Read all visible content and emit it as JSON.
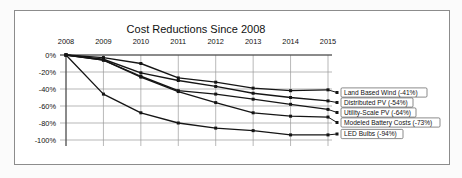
{
  "chart_data": {
    "type": "line",
    "title": "Cost Reductions Since 2008",
    "xlabel": "",
    "ylabel": "",
    "x": [
      "2008",
      "2009",
      "2010",
      "2011",
      "2012",
      "2013",
      "2014",
      "2015"
    ],
    "categories": [
      "2008",
      "2009",
      "2010",
      "2011",
      "2012",
      "2013",
      "2014",
      "2015"
    ],
    "ytick_labels": [
      "0%",
      "-20%",
      "-40%",
      "-60%",
      "-80%",
      "-100%"
    ],
    "ytick_values": [
      0,
      -20,
      -40,
      -60,
      -80,
      -100
    ],
    "ylim": [
      -100,
      0
    ],
    "grid": true,
    "xaxis_position": "top",
    "legend_position": "right-callouts",
    "series": [
      {
        "name": "Land Based Wind (-41%)",
        "label": "Land Based Wind (-41%)",
        "final_value": -41,
        "values": [
          0,
          -3,
          -10,
          -27,
          -32,
          -39,
          -42,
          -41
        ]
      },
      {
        "name": "Distributed PV (-54%)",
        "label": "Distributed PV (-54%)",
        "final_value": -54,
        "values": [
          0,
          -5,
          -21,
          -30,
          -37,
          -45,
          -50,
          -54
        ]
      },
      {
        "name": "Utility-Scale PV (-64%)",
        "label": "Utility-Scale PV (-64%)",
        "final_value": -64,
        "values": [
          0,
          -6,
          -25,
          -42,
          -46,
          -52,
          -58,
          -64
        ]
      },
      {
        "name": "Modeled Battery Costs (-73%)",
        "label": "Modeled Battery Costs (-73%)",
        "final_value": -73,
        "values": [
          0,
          -6,
          -26,
          -43,
          -56,
          -68,
          -72,
          -73
        ]
      },
      {
        "name": "LED Bulbs (-94%)",
        "label": "LED Bulbs (-94%)",
        "final_value": -94,
        "values": [
          0,
          -46,
          -68,
          -80,
          -86,
          -89,
          -94,
          -94
        ]
      }
    ]
  },
  "colors": {
    "line": "#151515",
    "grid": "#9a9a9a",
    "axis": "#3a3a3a",
    "frame": "#8c8c8c",
    "background": "#ffffff",
    "page_background": "#fbfbfb"
  }
}
